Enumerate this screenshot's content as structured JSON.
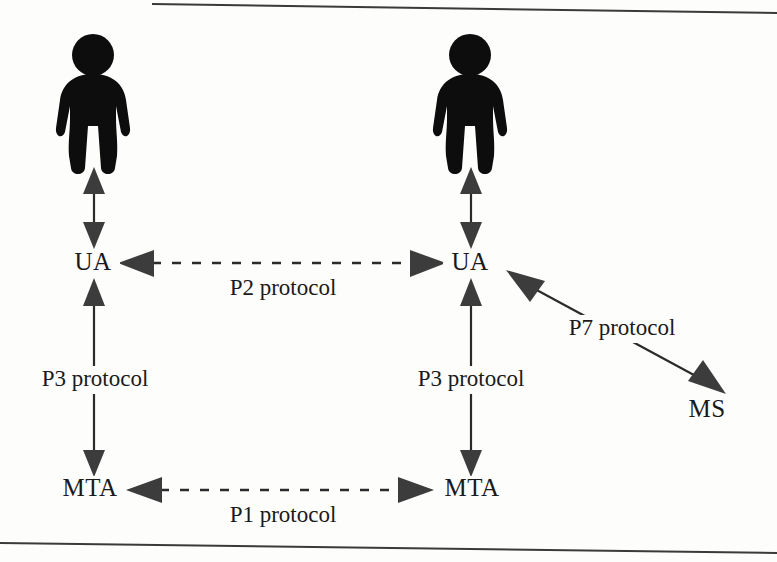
{
  "diagram": {
    "background_color": "#fdfdfc",
    "ink_color": "#2b2b2b",
    "nodes": [
      {
        "id": "user-left",
        "label": "",
        "type": "person-icon",
        "x": 93,
        "y": 100
      },
      {
        "id": "ua-left",
        "label": "UA",
        "type": "text-node",
        "x": 93,
        "y": 264
      },
      {
        "id": "mta-left",
        "label": "MTA",
        "type": "text-node",
        "x": 90,
        "y": 490
      },
      {
        "id": "user-right",
        "label": "",
        "type": "person-icon",
        "x": 470,
        "y": 100
      },
      {
        "id": "ua-right",
        "label": "UA",
        "type": "text-node",
        "x": 470,
        "y": 264
      },
      {
        "id": "mta-right",
        "label": "MTA",
        "type": "text-node",
        "x": 472,
        "y": 490
      },
      {
        "id": "ms",
        "label": "MS",
        "type": "text-node",
        "x": 707,
        "y": 411
      }
    ],
    "edges": [
      {
        "id": "edge-user-ua-left",
        "label": "",
        "style": "solid",
        "arrows": "both",
        "from": "user-left",
        "to": "ua-left"
      },
      {
        "id": "edge-user-ua-right",
        "label": "",
        "style": "solid",
        "arrows": "both",
        "from": "user-right",
        "to": "ua-right"
      },
      {
        "id": "edge-p2",
        "label": "P2 protocol",
        "style": "dashed",
        "arrows": "both",
        "from": "ua-left",
        "to": "ua-right"
      },
      {
        "id": "edge-p3-left",
        "label": "P3 protocol",
        "style": "solid",
        "arrows": "both",
        "from": "ua-left",
        "to": "mta-left"
      },
      {
        "id": "edge-p3-right",
        "label": "P3 protocol",
        "style": "solid",
        "arrows": "both",
        "from": "ua-right",
        "to": "mta-right"
      },
      {
        "id": "edge-p1",
        "label": "P1 protocol",
        "style": "dashed",
        "arrows": "both",
        "from": "mta-left",
        "to": "mta-right"
      },
      {
        "id": "edge-p7",
        "label": "P7 protocol",
        "style": "solid",
        "arrows": "both",
        "from": "ua-right",
        "to": "ms"
      }
    ],
    "edge_labels": {
      "p2": "P2 protocol",
      "p3_left": "P3 protocol",
      "p3_right": "P3 protocol",
      "p1": "P1 protocol",
      "p7": "P7 protocol"
    },
    "node_labels": {
      "ua_left": "UA",
      "ua_right": "UA",
      "mta_left": "MTA",
      "mta_right": "MTA",
      "ms": "MS"
    }
  }
}
